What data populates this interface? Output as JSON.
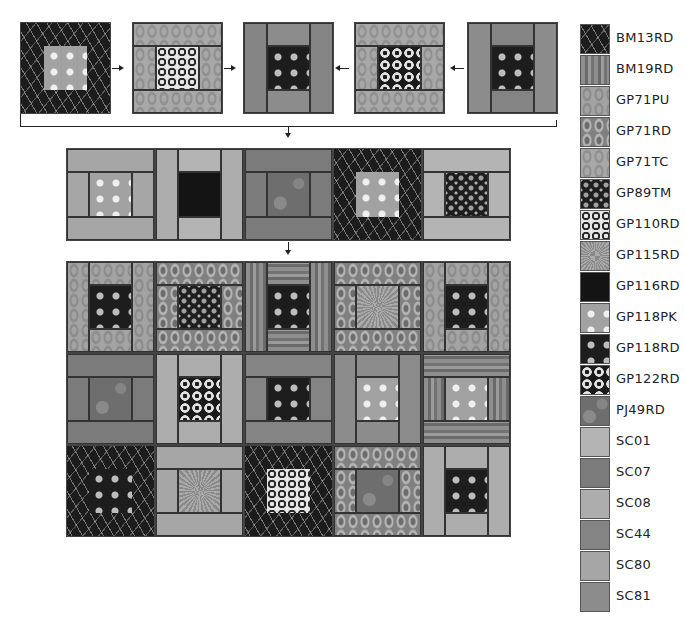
{
  "legend": [
    {
      "code": "BM13RD"
    },
    {
      "code": "BM19RD"
    },
    {
      "code": "GP71PU"
    },
    {
      "code": "GP71RD"
    },
    {
      "code": "GP71TC"
    },
    {
      "code": "GP89TM"
    },
    {
      "code": "GP110RD"
    },
    {
      "code": "GP115RD"
    },
    {
      "code": "GP116RD"
    },
    {
      "code": "GP118PK"
    },
    {
      "code": "GP118RD"
    },
    {
      "code": "GP122RD"
    },
    {
      "code": "PJ49RD"
    },
    {
      "code": "SC01"
    },
    {
      "code": "SC07"
    },
    {
      "code": "SC08"
    },
    {
      "code": "SC44"
    },
    {
      "code": "SC80"
    },
    {
      "code": "SC81"
    }
  ],
  "colors": {
    "line": "#222222",
    "background": "#ffffff"
  },
  "top_row": [
    {
      "style": "frame",
      "outer": "BM13RD",
      "center": "GP118PK"
    },
    {
      "style": "h",
      "top": "GP71TC",
      "bottom": "GP71TC",
      "left": "GP71TC",
      "right": "GP71TC",
      "center": "GP110RD"
    },
    {
      "style": "v",
      "top": "SC81",
      "bottom": "SC81",
      "left": "SC44",
      "right": "SC44",
      "center": "GP118RD"
    },
    {
      "style": "h",
      "top": "GP71TC",
      "bottom": "GP71TC",
      "left": "GP71TC",
      "right": "GP71TC",
      "center": "GP122RD"
    },
    {
      "style": "v",
      "top": "SC44",
      "bottom": "SC44",
      "left": "SC81",
      "right": "SC81",
      "center": "GP118RD"
    }
  ],
  "middle_row": [
    {
      "style": "h",
      "top": "SC80",
      "bottom": "SC80",
      "left": "SC80",
      "right": "SC80",
      "center": "GP118PK"
    },
    {
      "style": "v",
      "top": "SC01",
      "bottom": "SC01",
      "left": "SC08",
      "right": "SC08",
      "center": "GP116RD"
    },
    {
      "style": "h",
      "top": "SC07",
      "bottom": "SC07",
      "left": "SC07",
      "right": "SC07",
      "center": "PJ49RD"
    },
    {
      "style": "frame",
      "outer": "BM13RD",
      "center": "GP118PK"
    },
    {
      "style": "h",
      "top": "SC01",
      "bottom": "SC01",
      "left": "SC01",
      "right": "SC01",
      "center": "GP89TM"
    }
  ],
  "quilt_rows": [
    [
      {
        "style": "v",
        "top": "GP71PU",
        "bottom": "GP71PU",
        "left": "GP71PU",
        "right": "GP71PU",
        "center": "GP118RD"
      },
      {
        "style": "h",
        "top": "GP71RD",
        "bottom": "GP71RD",
        "left": "GP71RD",
        "right": "GP71RD",
        "center": "GP89TM"
      },
      {
        "style": "v",
        "top": "BM19RD-h",
        "bottom": "BM19RD-h",
        "left": "BM19RD",
        "right": "BM19RD",
        "center": "GP118RD"
      },
      {
        "style": "h",
        "top": "GP71RD",
        "bottom": "GP71RD",
        "left": "GP71RD",
        "right": "GP71RD",
        "center": "GP115RD"
      },
      {
        "style": "v",
        "top": "GP71PU",
        "bottom": "GP71PU",
        "left": "GP71PU",
        "right": "GP71PU",
        "center": "GP118RD"
      }
    ],
    [
      {
        "style": "h",
        "top": "SC07",
        "bottom": "SC07",
        "left": "SC07",
        "right": "SC07",
        "center": "PJ49RD"
      },
      {
        "style": "v",
        "top": "SC08",
        "bottom": "SC08",
        "left": "SC08",
        "right": "SC08",
        "center": "GP122RD"
      },
      {
        "style": "h",
        "top": "SC44",
        "bottom": "SC44",
        "left": "SC44",
        "right": "SC44",
        "center": "GP118RD"
      },
      {
        "style": "v",
        "top": "SC81",
        "bottom": "SC81",
        "left": "SC81",
        "right": "SC81",
        "center": "GP118PK"
      },
      {
        "style": "h",
        "top": "BM19RD-h",
        "bottom": "BM19RD-h",
        "left": "BM19RD",
        "right": "BM19RD",
        "center": "GP118PK"
      }
    ],
    [
      {
        "style": "frame",
        "outer": "BM13RD",
        "center": "GP118RD"
      },
      {
        "style": "h",
        "top": "SC80",
        "bottom": "SC80",
        "left": "SC80",
        "right": "SC80",
        "center": "GP115RD"
      },
      {
        "style": "frame",
        "outer": "BM13RD",
        "center": "GP110RD"
      },
      {
        "style": "h",
        "top": "GP71RD",
        "bottom": "GP71RD",
        "left": "GP71RD",
        "right": "GP71RD",
        "center": "PJ49RD"
      },
      {
        "style": "v",
        "top": "SC08",
        "bottom": "SC08",
        "left": "SC08",
        "right": "SC08",
        "center": "GP118RD"
      }
    ]
  ]
}
